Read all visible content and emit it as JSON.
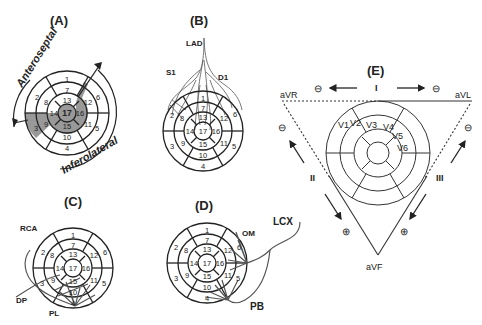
{
  "panels": {
    "A": {
      "title": "(A)",
      "arc_labels": [
        "Anteroseptal",
        "Inferolateral"
      ],
      "shaded_segments": [
        3,
        9,
        14,
        15,
        16,
        12,
        17
      ],
      "segments": [
        "1",
        "2",
        "3",
        "4",
        "5",
        "6",
        "7",
        "8",
        "9",
        "10",
        "11",
        "12",
        "13",
        "14",
        "15",
        "16",
        "17"
      ]
    },
    "B": {
      "title": "(B)",
      "artery_labels": [
        "LAD",
        "S1",
        "D1"
      ],
      "segments": [
        "1",
        "2",
        "3",
        "4",
        "5",
        "6",
        "7",
        "8",
        "9",
        "10",
        "11",
        "12",
        "13",
        "14",
        "15",
        "16",
        "17"
      ]
    },
    "C": {
      "title": "(C)",
      "artery_labels": [
        "RCA",
        "DP",
        "PL"
      ],
      "segments": [
        "1",
        "2",
        "3",
        "4",
        "5",
        "6",
        "7",
        "8",
        "9",
        "10",
        "11",
        "12",
        "13",
        "14",
        "15",
        "16",
        "17"
      ]
    },
    "D": {
      "title": "(D)",
      "artery_labels": [
        "LCX",
        "OM",
        "PB"
      ],
      "segments": [
        "1",
        "2",
        "3",
        "4",
        "5",
        "6",
        "7",
        "8",
        "9",
        "10",
        "11",
        "12",
        "13",
        "14",
        "15",
        "16",
        "17"
      ]
    },
    "E": {
      "title": "(E)",
      "limb_leads": [
        "I",
        "II",
        "III"
      ],
      "augmented_leads": [
        "aVR",
        "aVL",
        "aVF"
      ],
      "precordial_leads": [
        "V1",
        "V2",
        "V3",
        "V4",
        "V5",
        "V6"
      ],
      "polarity_symbols": {
        "negative": "⊖",
        "positive": "⊕"
      }
    }
  }
}
